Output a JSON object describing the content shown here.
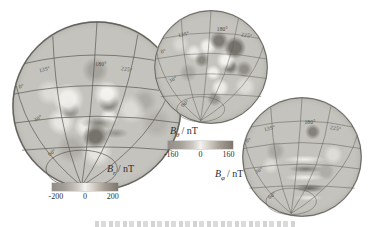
{
  "figure": {
    "description_type": "three orthographic globe maps of magnetic field components with colorbars",
    "panels": [
      {
        "id": "br",
        "field_symbol": "B",
        "field_subscript": "r",
        "unit_suffix": "/ nT",
        "meridian_labels": [
          "135°",
          "180°",
          "225°"
        ],
        "latitude_labels": [
          "0°",
          "30°",
          "60°"
        ],
        "colorbar": {
          "ticks": [
            "-200",
            "0",
            "200"
          ]
        }
      },
      {
        "id": "btheta",
        "field_symbol": "B",
        "field_subscript": "θ",
        "unit_suffix": "/ nT",
        "meridian_labels": [
          "135°",
          "180°",
          "225°"
        ],
        "latitude_labels": [
          "0°",
          "30°",
          "60°"
        ],
        "colorbar": {
          "ticks": [
            "-160",
            "0",
            "160"
          ]
        }
      },
      {
        "id": "bphi",
        "field_symbol": "B",
        "field_subscript": "φ",
        "unit_suffix": "/ nT",
        "meridian_labels": [
          "135°",
          "180°",
          "225°"
        ],
        "latitude_labels": [
          "0°",
          "30°",
          "60°"
        ],
        "colorbar": null
      }
    ],
    "colors": {
      "globe_base": "#c5c3bd",
      "blob_light": "#f0efeb",
      "blob_dark": "#82807a",
      "graticule": "#5a5953",
      "colorbar_negative_end": "#928d86",
      "colorbar_zero": "#f3f2ef",
      "colorbar_positive_end": "#7f776e"
    },
    "caption_fragment": ""
  }
}
